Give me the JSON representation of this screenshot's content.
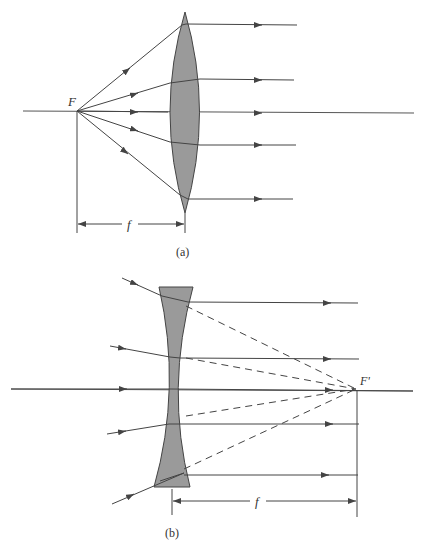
{
  "figure_a": {
    "caption": "(a)",
    "focal_point_label": "F",
    "focal_length_label": "f",
    "lens_type": "converging (biconvex)",
    "lens_fill": "#9a9a9a",
    "line_color": "#444444"
  },
  "figure_b": {
    "caption": "(b)",
    "focal_point_label": "F'",
    "focal_length_label": "f",
    "lens_type": "diverging (biconcave)",
    "lens_fill": "#9a9a9a",
    "line_color": "#444444"
  }
}
